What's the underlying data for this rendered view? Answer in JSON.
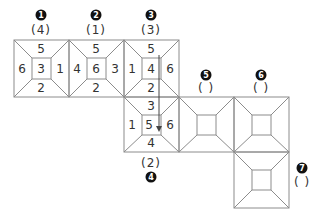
{
  "diagram": {
    "stroke_color": "#8c8c8c",
    "arrow_color": "#444444",
    "squares": [
      {
        "id": 1,
        "marker": "1",
        "answer": "(4)",
        "faces": {
          "top": "5",
          "left": "6",
          "center": "3",
          "right": "1",
          "bottom": "2"
        }
      },
      {
        "id": 2,
        "marker": "2",
        "answer": "(1)",
        "faces": {
          "top": "5",
          "left": "4",
          "center": "6",
          "right": "3",
          "bottom": "2"
        }
      },
      {
        "id": 3,
        "marker": "3",
        "answer": "(3)",
        "faces": {
          "top": "5",
          "left": "1",
          "center": "4",
          "right": "6",
          "bottom": "2"
        }
      },
      {
        "id": 4,
        "marker": "4",
        "answer": "(2)",
        "faces": {
          "top": "3",
          "left": "1",
          "center": "5",
          "right": "6",
          "bottom": "4"
        }
      },
      {
        "id": 5,
        "marker": "5",
        "answer": "(  )",
        "faces": {}
      },
      {
        "id": 6,
        "marker": "6",
        "answer": "(  )",
        "faces": {}
      },
      {
        "id": 7,
        "marker": "7",
        "answer": "(  )",
        "faces": {}
      }
    ]
  }
}
